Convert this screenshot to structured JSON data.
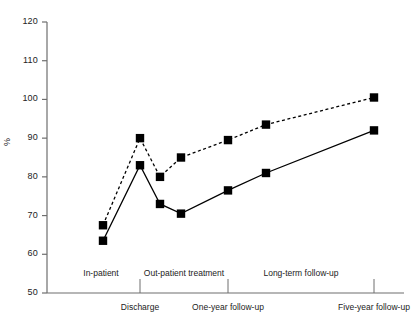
{
  "chart_data": {
    "type": "line",
    "title": "",
    "subtitle": "",
    "xlabel": "",
    "ylabel": "%",
    "ylim": [
      50,
      120
    ],
    "y_ticks": [
      50,
      60,
      70,
      80,
      90,
      100,
      110,
      120
    ],
    "y_tick_labels": [
      "50",
      "60",
      "70",
      "80",
      "90",
      "100",
      "110",
      "120"
    ],
    "grid": false,
    "legend": null,
    "x": [
      0,
      1,
      2,
      3,
      4,
      5,
      6
    ],
    "x_positions_px": [
      103,
      140,
      160,
      181,
      228,
      266,
      374
    ],
    "x_tick_labels": [
      "Discharge",
      "One-year follow-up",
      "Five-year follow-up"
    ],
    "x_tick_positions": [
      140,
      228,
      374
    ],
    "phase_brackets": [
      {
        "label": "In-patient",
        "start_px": 62,
        "end_px": 140
      },
      {
        "label": "Out-patient treatment",
        "start_px": 140,
        "end_px": 228
      },
      {
        "label": "Long-term follow-up",
        "start_px": 228,
        "end_px": 374
      }
    ],
    "series": [
      {
        "name": "dashed-series",
        "style": "dashed",
        "marker": "square",
        "color": "#000000",
        "values": [
          67.5,
          90.0,
          80.0,
          85.0,
          89.5,
          93.5,
          100.5
        ]
      },
      {
        "name": "solid-series",
        "style": "solid",
        "marker": "square",
        "color": "#000000",
        "values": [
          63.5,
          83.0,
          73.0,
          70.5,
          76.5,
          81.0,
          92.0
        ]
      }
    ]
  },
  "axis": {
    "y_axis_name": "y-axis",
    "x_axis_name": "x-axis"
  }
}
